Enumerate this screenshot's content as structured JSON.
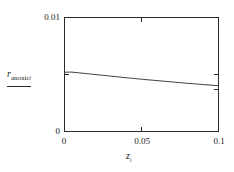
{
  "figure": {
    "background_color": "#ffffff",
    "line_color": "#2b2b2b",
    "frame_color": "#2b2b2b"
  },
  "axes": {
    "y": {
      "title_main": "r",
      "title_sub": "anoxic",
      "title_subsub": "i",
      "tick_labels": [
        "0",
        "0.01"
      ],
      "min_label": "0",
      "max_label": "0.01"
    },
    "x": {
      "title_main": "z",
      "title_sub": "i",
      "tick_labels": [
        "0",
        "0.05",
        "0.1"
      ],
      "label_0": "0",
      "label_mid": "0.05",
      "label_max": "0.1"
    }
  },
  "chart_data": {
    "type": "line",
    "title": "",
    "xlabel": "z_i",
    "ylabel": "r_anoxic_i",
    "xlim": [
      0,
      0.1
    ],
    "ylim": [
      0,
      0.01
    ],
    "xticks": [
      0,
      0.05,
      0.1
    ],
    "yticks": [
      0,
      0.01
    ],
    "grid": false,
    "legend": null,
    "series": [
      {
        "name": "r_anoxic_i",
        "x": [
          0.0,
          0.005,
          0.01,
          0.015,
          0.02,
          0.025,
          0.03,
          0.035,
          0.04,
          0.045,
          0.05,
          0.055,
          0.06,
          0.065,
          0.07,
          0.075,
          0.08,
          0.085,
          0.09,
          0.095,
          0.1
        ],
        "y": [
          0.0052,
          0.00521,
          0.00514,
          0.00507,
          0.005,
          0.00493,
          0.00486,
          0.00479,
          0.00472,
          0.00466,
          0.00459,
          0.00453,
          0.00447,
          0.00441,
          0.00435,
          0.00429,
          0.00423,
          0.00418,
          0.00412,
          0.00407,
          0.00402
        ]
      }
    ]
  }
}
